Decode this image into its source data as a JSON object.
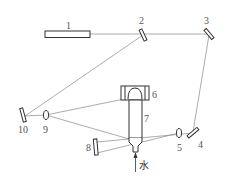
{
  "figure": {
    "type": "optical-setup-schematic",
    "labels": {
      "laser": "1",
      "mirror_2": "2",
      "mirror_3": "3",
      "mirror_4": "4",
      "lens_5": "5",
      "element_6": "6",
      "tube_7": "7",
      "mirror_8": "8",
      "lens_9": "9",
      "mirror_10": "10",
      "water": "水"
    },
    "colors": {
      "line": "#888888",
      "component": "#333333",
      "label": "#555555"
    }
  }
}
